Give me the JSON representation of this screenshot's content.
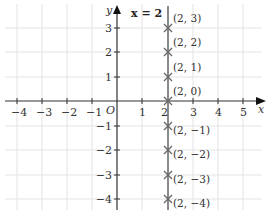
{
  "diagram": {
    "type": "coordinate-grid",
    "x_axis_label": "x",
    "y_axis_label": "y",
    "origin_label": "O",
    "line_label": "x = 2",
    "x_ticks": [
      "−4",
      "−3",
      "−2",
      "−1",
      "1",
      "2",
      "3",
      "4",
      "5"
    ],
    "y_ticks": [
      "3",
      "2",
      "1",
      "−1",
      "−2",
      "−3",
      "−4"
    ],
    "points": [
      {
        "label": "(2, 3)",
        "x": 2,
        "y": 3
      },
      {
        "label": "(2, 2)",
        "x": 2,
        "y": 2
      },
      {
        "label": "(2, 1)",
        "x": 2,
        "y": 1
      },
      {
        "label": "(2, 0)",
        "x": 2,
        "y": 0
      },
      {
        "label": "(2, −1)",
        "x": 2,
        "y": -1
      },
      {
        "label": "(2, −2)",
        "x": 2,
        "y": -2
      },
      {
        "label": "(2, −3)",
        "x": 2,
        "y": -3
      },
      {
        "label": "(2, −4)",
        "x": 2,
        "y": -4
      }
    ],
    "colors": {
      "grid": "#e2e2e2",
      "axis": "#333333",
      "line": "#8a8a8a",
      "marker": "#666666"
    }
  }
}
